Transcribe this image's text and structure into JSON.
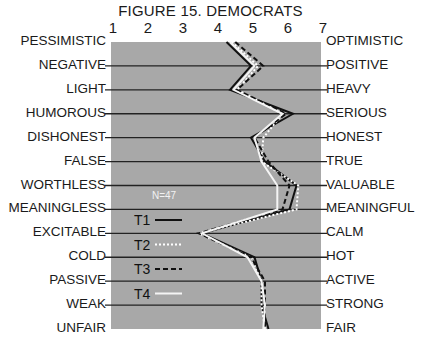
{
  "title": "FIGURE 15. DEMOCRATS",
  "chart_data": {
    "type": "line",
    "title": "FIGURE 15. DEMOCRATS",
    "orientation": "horizontal semantic differential profile",
    "x_ticks": [
      "1",
      "2",
      "3",
      "4",
      "5",
      "6",
      "7"
    ],
    "xlim": [
      1,
      7
    ],
    "left_labels": [
      "PESSIMISTIC",
      "NEGATIVE",
      "LIGHT",
      "HUMOROUS",
      "DISHONEST",
      "FALSE",
      "WORTHLESS",
      "MEANINGLESS",
      "EXCITABLE",
      "COLD",
      "PASSIVE",
      "WEAK",
      "UNFAIR"
    ],
    "right_labels": [
      "OPTIMISTIC",
      "POSITIVE",
      "HEAVY",
      "SERIOUS",
      "HONEST",
      "TRUE",
      "VALUABLE",
      "MEANINGFUL",
      "CALM",
      "HOT",
      "ACTIVE",
      "STRONG",
      "FAIR"
    ],
    "annotation": "N=47",
    "series": [
      {
        "name": "T1",
        "style": "solid-black",
        "values": [
          4.3,
          5.0,
          4.4,
          6.2,
          5.0,
          5.4,
          6.3,
          6.1,
          3.6,
          5.1,
          5.3,
          5.3,
          5.5
        ]
      },
      {
        "name": "T2",
        "style": "dotted-white",
        "values": [
          4.45,
          5.2,
          4.6,
          5.9,
          5.35,
          5.3,
          6.35,
          6.3,
          3.5,
          5.0,
          5.3,
          5.3,
          5.4
        ]
      },
      {
        "name": "T3",
        "style": "dashed-black",
        "values": [
          4.55,
          5.35,
          4.6,
          6.0,
          5.1,
          5.5,
          6.1,
          5.9,
          3.5,
          5.0,
          5.4,
          5.4,
          5.4
        ]
      },
      {
        "name": "T4",
        "style": "solid-white",
        "values": [
          4.4,
          5.1,
          4.5,
          5.9,
          5.1,
          5.3,
          5.75,
          5.75,
          3.6,
          4.9,
          5.3,
          5.4,
          5.35
        ]
      }
    ],
    "grid": true,
    "background": "#a8a8a8",
    "legend_position": "inside-left-lower"
  }
}
